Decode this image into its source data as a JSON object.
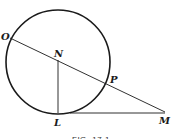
{
  "figure": {
    "caption": "FIG. 17.1",
    "points": {
      "O": "O",
      "N": "N",
      "P": "P",
      "L": "L",
      "M": "M"
    },
    "segments": [
      "ON",
      "NP",
      "PM",
      "NL",
      "LM"
    ]
  },
  "colors": {
    "stroke": "#1a1a1a",
    "background": "#ffffff"
  }
}
